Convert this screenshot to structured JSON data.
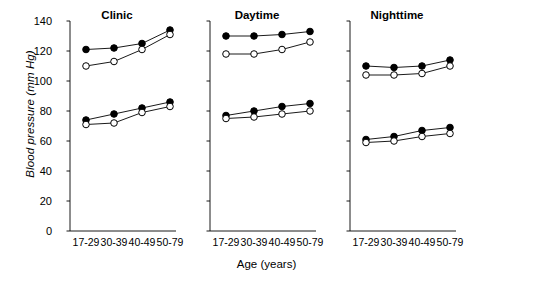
{
  "chart_data": {
    "type": "line",
    "title": "",
    "xlabel": "Age (years)",
    "ylabel": "Blood pressure (mm Hg)",
    "categories": [
      "17-29",
      "30-39",
      "40-49",
      "50-79"
    ],
    "ylim": [
      0,
      140
    ],
    "yticks": [
      0,
      20,
      40,
      60,
      80,
      100,
      120,
      140
    ],
    "ytick_labels": [
      "0",
      "20",
      "40",
      "60",
      "80",
      "100",
      "120",
      "140"
    ],
    "grid": false,
    "legend": "none",
    "marker_filled_color": "#000000",
    "marker_open_color": "#ffffff",
    "line_color": "#000000",
    "panels": [
      {
        "title": "Clinic",
        "series": [
          {
            "name": "systolic-men",
            "marker": "filled",
            "values": [
              121,
              122,
              125,
              134
            ]
          },
          {
            "name": "systolic-women",
            "marker": "open",
            "values": [
              110,
              113,
              121,
              131
            ]
          },
          {
            "name": "diastolic-men",
            "marker": "filled",
            "values": [
              74,
              78,
              82,
              86
            ]
          },
          {
            "name": "diastolic-women",
            "marker": "open",
            "values": [
              71,
              72,
              79,
              83
            ]
          }
        ]
      },
      {
        "title": "Daytime",
        "series": [
          {
            "name": "systolic-men",
            "marker": "filled",
            "values": [
              130,
              130,
              131,
              133
            ]
          },
          {
            "name": "systolic-women",
            "marker": "open",
            "values": [
              118,
              118,
              121,
              126
            ]
          },
          {
            "name": "diastolic-men",
            "marker": "filled",
            "values": [
              77,
              80,
              83,
              85
            ]
          },
          {
            "name": "diastolic-women",
            "marker": "open",
            "values": [
              75,
              76,
              78,
              80
            ]
          }
        ]
      },
      {
        "title": "Nighttime",
        "series": [
          {
            "name": "systolic-men",
            "marker": "filled",
            "values": [
              110,
              109,
              110,
              114
            ]
          },
          {
            "name": "systolic-women",
            "marker": "open",
            "values": [
              104,
              104,
              105,
              110
            ]
          },
          {
            "name": "diastolic-men",
            "marker": "filled",
            "values": [
              61,
              63,
              67,
              69
            ]
          },
          {
            "name": "diastolic-women",
            "marker": "open",
            "values": [
              59,
              60,
              63,
              65
            ]
          }
        ]
      }
    ]
  }
}
